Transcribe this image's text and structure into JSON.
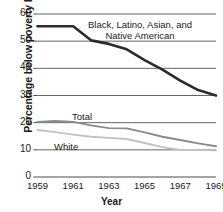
{
  "chart_data": {
    "type": "line",
    "title": "",
    "xlabel": "Year",
    "ylabel": "Percentage below poverty level",
    "xlim": [
      1959,
      1969
    ],
    "ylim": [
      0,
      60
    ],
    "grid": true,
    "legend_position": "inline-annotations",
    "yticks": [
      0,
      10,
      20,
      30,
      40,
      50,
      60
    ],
    "ytick_labels": [
      "0",
      "10",
      "20",
      "30",
      "40",
      "50",
      "60"
    ],
    "xticks": [
      1959,
      1961,
      1963,
      1965,
      1967,
      1969
    ],
    "xtick_labels": [
      "1959",
      "1961",
      "1963",
      "1965",
      "1967",
      "1969"
    ],
    "x": [
      1959,
      1960,
      1961,
      1962,
      1963,
      1964,
      1965,
      1966,
      1967,
      1968,
      1969
    ],
    "series": [
      {
        "name": "Black, Latino, Asian, and Native American",
        "color": "#2b2b2b",
        "width": 2.6,
        "values": [
          55.5,
          55.5,
          55.5,
          50.3,
          49.0,
          47.0,
          43.0,
          39.5,
          35.5,
          32.0,
          30.0
        ]
      },
      {
        "name": "Total",
        "color": "#8a8a8a",
        "width": 1.9,
        "values": [
          20.3,
          20.6,
          20.3,
          19.0,
          18.0,
          17.9,
          16.4,
          14.8,
          13.6,
          12.4,
          11.3
        ]
      },
      {
        "name": "White",
        "color": "#c2c2c2",
        "width": 1.9,
        "values": [
          17.3,
          16.5,
          15.6,
          14.8,
          14.4,
          14.0,
          12.5,
          11.0,
          10.0,
          10.0,
          9.8
        ]
      }
    ],
    "annotations": [
      {
        "id": "series-label-minority",
        "text": "Black, Latino, Asian, and\nNative American",
        "line1": "Black, Latino, Asian, and",
        "line2": "Native American"
      },
      {
        "id": "series-label-total",
        "text": "Total"
      },
      {
        "id": "series-label-white",
        "text": "White"
      }
    ]
  }
}
